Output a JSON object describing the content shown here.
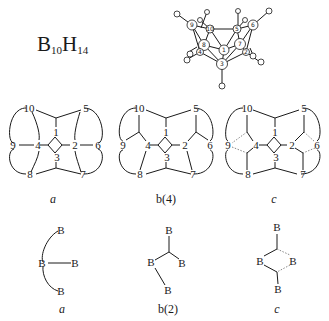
{
  "formula": {
    "b": "B",
    "b_sub": "10",
    "h": "H",
    "h_sub": "14"
  },
  "molecule": {
    "atoms": [
      "9",
      "10",
      "5",
      "6",
      "8",
      "1",
      "7",
      "4",
      "2",
      "3"
    ]
  },
  "topology_diagrams": [
    {
      "caption": "a",
      "nodes": [
        "10",
        "5",
        "9",
        "4",
        "1",
        "2",
        "6",
        "3",
        "8",
        "7"
      ]
    },
    {
      "caption": "b(4)",
      "nodes": [
        "10",
        "5",
        "9",
        "4",
        "1",
        "2",
        "6",
        "3",
        "8",
        "7"
      ]
    },
    {
      "caption": "c",
      "nodes": [
        "10",
        "5",
        "9",
        "4",
        "1",
        "2",
        "6",
        "3",
        "8",
        "7"
      ]
    }
  ],
  "bond_types": [
    {
      "caption": "a",
      "atoms": [
        "B",
        "B",
        "B",
        "B"
      ]
    },
    {
      "caption": "b(2)",
      "atoms": [
        "B",
        "B",
        "B",
        "B"
      ]
    },
    {
      "caption": "c",
      "atoms": [
        "B",
        "B",
        "B",
        "B"
      ]
    }
  ]
}
